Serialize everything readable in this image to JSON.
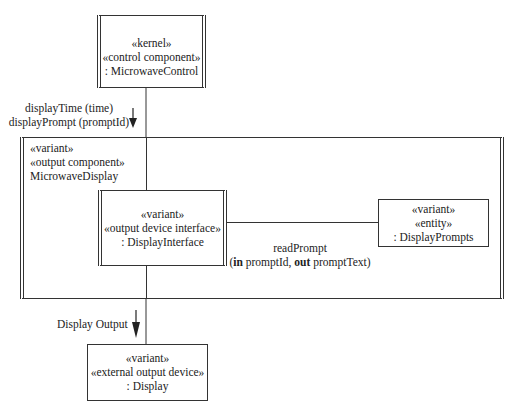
{
  "diagram": {
    "type": "uml-component-collaboration",
    "nodes": {
      "microwave_control": {
        "line1": "«kernel»",
        "line2": "«control component»",
        "line3": ": MicrowaveControl"
      },
      "microwave_display": {
        "line1": "«variant»",
        "line2": "«output component»",
        "line3": "MicrowaveDisplay"
      },
      "display_interface": {
        "line1": "«variant»",
        "line2": "«output device interface»",
        "line3": ": DisplayInterface"
      },
      "display_prompts": {
        "line1": "«variant»",
        "line2": "«entity»",
        "line3": ": DisplayPrompts"
      },
      "display": {
        "line1": "«variant»",
        "line2": "«external output device»",
        "line3": ": Display"
      }
    },
    "messages": {
      "control_to_display": {
        "line1": "displayTime (time)",
        "line2": "displayPrompt (promptId)"
      },
      "read_prompt": {
        "name": "readPrompt",
        "open_paren": "(",
        "in_kw": "in",
        "in_param": " promptId, ",
        "out_kw": "out",
        "out_param": " promptText)"
      },
      "display_output": {
        "label": "Display Output"
      }
    }
  }
}
